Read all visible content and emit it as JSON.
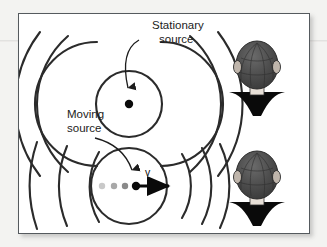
{
  "figure": {
    "type": "physics-diagram",
    "background_color": "#f3f3f1",
    "panel_background": "#ffffff",
    "frame_border_color": "#555a5e",
    "ink_color": "#1c1c1c",
    "wave_color": "#2b2b2b",
    "trail_dot_colors": [
      "#c9c9c9",
      "#a8a8a8",
      "#8a8a8a"
    ],
    "hair_color": "#4a4a4a",
    "shirt_color": "#0a0a0a"
  },
  "labels": {
    "stationary_source_line1": "Stationary",
    "stationary_source_line2": "source",
    "moving_source_line1": "Moving",
    "moving_source_line2": "source",
    "velocity": "v",
    "observer": "Observer"
  },
  "panels": [
    {
      "id": "stationary",
      "source_label": "Stationary source",
      "source_x": 110,
      "source_y": 60,
      "source_moving": false,
      "wavefront_radii": [
        33,
        62,
        90,
        118
      ],
      "symmetric": true,
      "description": "Concentric circular wavefronts evenly spaced on both sides"
    },
    {
      "id": "moving",
      "source_label": "Moving source",
      "source_x": 116,
      "source_y": 170,
      "source_moving": true,
      "velocity_label": "v",
      "velocity_direction": "right",
      "wavefront_radii_left": [
        38,
        70,
        103,
        135
      ],
      "wavefront_radii_right": [
        38,
        62,
        82,
        99
      ],
      "symmetric": false,
      "trail_dot_count": 3,
      "description": "Wavefronts compressed ahead of source, stretched behind"
    }
  ],
  "observers": [
    {
      "id": "observer-top",
      "x": 236,
      "y": 48,
      "labeled": false
    },
    {
      "id": "observer-bottom",
      "x": 236,
      "y": 158,
      "labeled": true,
      "label": "Observer"
    }
  ]
}
